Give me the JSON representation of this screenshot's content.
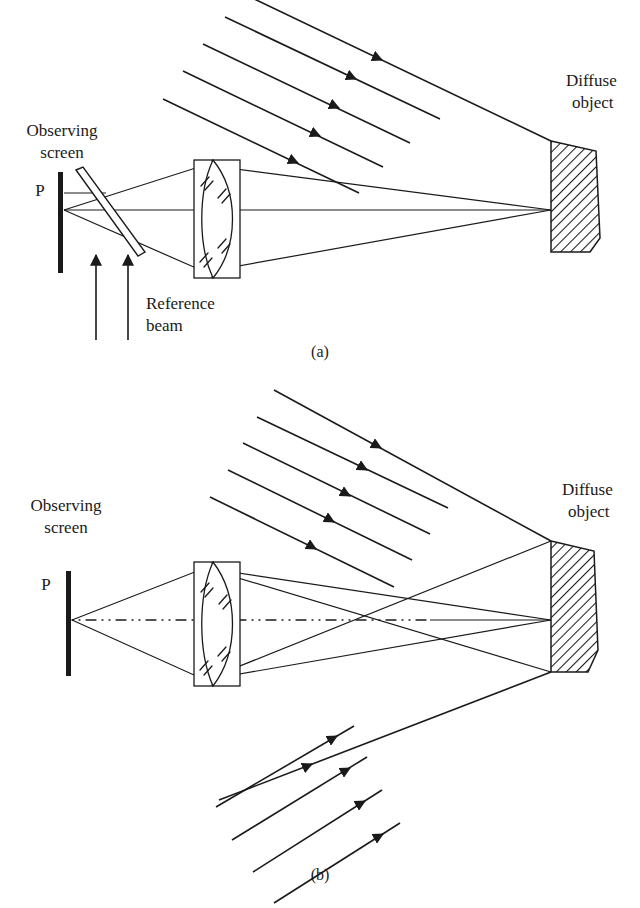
{
  "figure": {
    "background_color": "#ffffff",
    "ink_color": "#1a1a1a",
    "width": 640,
    "height": 908
  },
  "panels": [
    {
      "id": "a",
      "caption": "(a)",
      "caption_x": 320,
      "caption_y": 355,
      "labels": {
        "observing_screen_line1": "Observing",
        "observing_screen_line2": "screen",
        "point_label": "P",
        "diffuse_object_line1": "Diffuse",
        "diffuse_object_line2": "object",
        "reference_beam_line1": "Reference",
        "reference_beam_line2": "beam"
      },
      "components": {
        "screen": {
          "x": 58,
          "y_top": 172,
          "y_bottom": 273,
          "width": 5
        },
        "beam_splitter": {
          "type": "tilted-glass-plate",
          "angle_deg": 52,
          "p1": [
            78,
            172
          ],
          "p2": [
            138,
            250
          ],
          "thickness": 9
        },
        "lens": {
          "type": "biconvex-in-housing",
          "housing_x": 194,
          "housing_y": 160,
          "housing_w": 46,
          "housing_h": 118,
          "hatch_tick_count": 8
        },
        "diffuse_object": {
          "type": "hatched-polygon",
          "points": "551,141 596,151 600,238 590,252 551,252",
          "hatch_angle_deg": 45,
          "hatch_spacing": 6
        },
        "focus_point": [
          551,
          210
        ]
      },
      "illumination_rays": {
        "count": 5,
        "direction": "down-right",
        "arrow_position": "midpoint",
        "rays": [
          {
            "x1": 248,
            "y1": -4,
            "x2": 551,
            "y2": 141
          },
          {
            "x1": 225,
            "y1": 17,
            "x2": 440,
            "y2": 119
          },
          {
            "x1": 203,
            "y1": 44,
            "x2": 410,
            "y2": 143
          },
          {
            "x1": 183,
            "y1": 71,
            "x2": 383,
            "y2": 167
          },
          {
            "x1": 163,
            "y1": 99,
            "x2": 359,
            "y2": 193
          }
        ]
      },
      "reference_beam_arrows": [
        {
          "x": 96,
          "y1": 340,
          "y2": 253
        },
        {
          "x": 128,
          "y1": 340,
          "y2": 253
        }
      ]
    },
    {
      "id": "b",
      "caption": "(b)",
      "caption_x": 320,
      "caption_y": 878,
      "labels": {
        "observing_screen_line1": "Observing",
        "observing_screen_line2": "screen",
        "point_label": "P",
        "diffuse_object_line1": "Diffuse",
        "diffuse_object_line2": "object"
      },
      "components": {
        "screen": {
          "x": 66,
          "y_top": 571,
          "y_bottom": 676,
          "width": 5
        },
        "lens": {
          "type": "biconvex-in-housing",
          "housing_x": 194,
          "housing_y": 562,
          "housing_w": 46,
          "housing_h": 124,
          "hatch_tick_count": 8
        },
        "diffuse_object": {
          "type": "hatched-polygon",
          "points": "551,541 594,551 598,650 588,672 551,672",
          "hatch_angle_deg": 45,
          "hatch_spacing": 6
        },
        "focus_point": [
          551,
          620
        ],
        "optical_axis": {
          "x1": 70,
          "y1": 620,
          "x2": 551,
          "y2": 620,
          "style": "dash-dot"
        }
      },
      "illumination_rays_upper": {
        "count": 5,
        "direction": "down-right",
        "rays": [
          {
            "x1": 274,
            "y1": 390,
            "x2": 551,
            "y2": 541
          },
          {
            "x1": 257,
            "y1": 417,
            "x2": 448,
            "y2": 508
          },
          {
            "x1": 243,
            "y1": 443,
            "x2": 430,
            "y2": 534
          },
          {
            "x1": 228,
            "y1": 470,
            "x2": 412,
            "y2": 560
          },
          {
            "x1": 210,
            "y1": 497,
            "x2": 394,
            "y2": 587
          }
        ]
      },
      "illumination_rays_lower": {
        "count": 5,
        "direction": "up-right",
        "rays": [
          {
            "x1": 219,
            "y1": 800,
            "x2": 551,
            "y2": 672
          },
          {
            "x1": 216,
            "y1": 807,
            "x2": 354,
            "y2": 726
          },
          {
            "x1": 232,
            "y1": 840,
            "x2": 367,
            "y2": 757
          },
          {
            "x1": 253,
            "y1": 872,
            "x2": 382,
            "y2": 790
          },
          {
            "x1": 274,
            "y1": 903,
            "x2": 400,
            "y2": 823
          }
        ]
      }
    }
  ]
}
